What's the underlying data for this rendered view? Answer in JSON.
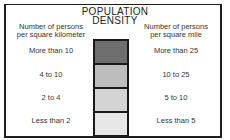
{
  "legend": {
    "title_line1": "POPULATION",
    "title_line2": "DENSITY",
    "left_header_line1": "Number of persons",
    "left_header_line2": "per square kilometer",
    "right_header_line1": "Number of persons",
    "right_header_line2": "per square mile",
    "rows": [
      {
        "left": "More than 10",
        "right": "More than 25",
        "color": "#6e6e6e"
      },
      {
        "left": "4 to 10",
        "right": "10 to 25",
        "color": "#bdbdbd"
      },
      {
        "left": "2 to 4",
        "right": "5 to 10",
        "color": "#d4d4d4"
      },
      {
        "left": "Less than 2",
        "right": "Less than 5",
        "color": "#e6e6e6"
      }
    ]
  }
}
